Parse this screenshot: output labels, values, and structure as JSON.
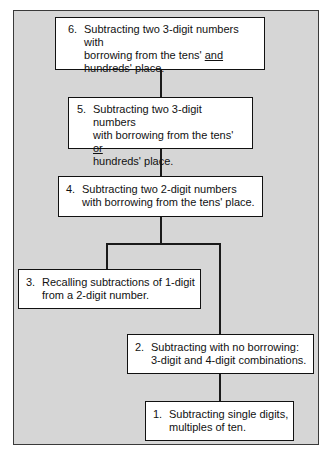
{
  "diagram": {
    "type": "hierarchy",
    "background_color": "#d6d6d6",
    "box_color": "#ffffff",
    "line_color": "#1a1a1a",
    "nodes": [
      {
        "id": "6",
        "number": "6.",
        "line1": "Subtracting two 3-digit numbers with",
        "line2_pre": "borrowing from the tens' ",
        "line2_emph": "and",
        "line3": "hundreds' place."
      },
      {
        "id": "5",
        "number": "5.",
        "line1": "Subtracting two 3-digit numbers",
        "line2_pre": "with borrowing from the tens' ",
        "line2_emph": "or",
        "line3": "hundreds' place."
      },
      {
        "id": "4",
        "number": "4.",
        "line1": "Subtracting two 2-digit numbers",
        "line2": "with borrowing from the tens' place."
      },
      {
        "id": "3",
        "number": "3.",
        "line1": "Recalling subtractions of 1-digit",
        "line2": "from a 2-digit number."
      },
      {
        "id": "2",
        "number": "2.",
        "line1": "Subtracting with no borrowing:",
        "line2": "3-digit and 4-digit combinations."
      },
      {
        "id": "1",
        "number": "1.",
        "line1": "Subtracting single digits,",
        "line2": "multiples of ten."
      }
    ],
    "edges": [
      {
        "from": "6",
        "to": "5"
      },
      {
        "from": "5",
        "to": "4"
      },
      {
        "from": "4",
        "to": "3"
      },
      {
        "from": "4",
        "to": "2"
      },
      {
        "from": "2",
        "to": "1"
      }
    ]
  }
}
